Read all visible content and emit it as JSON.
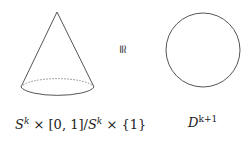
{
  "diagram": {
    "left": {
      "shape": "cone",
      "label_parts": {
        "s1": "S",
        "k1": "k",
        "times1": " × [0, 1]/",
        "s2": "S",
        "k2": "k",
        "times2": " × {1}"
      }
    },
    "relation": {
      "symbol": "≅"
    },
    "right": {
      "shape": "circle",
      "label_parts": {
        "d": "D",
        "exp": "k+1"
      }
    },
    "colors": {
      "stroke": "#555555",
      "text": "#222222"
    }
  }
}
